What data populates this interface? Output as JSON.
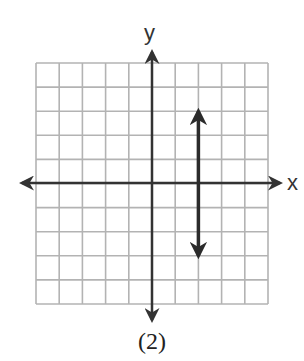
{
  "figure": {
    "caption": "(2)",
    "x_axis_label": "x",
    "y_axis_label": "y"
  },
  "grid": {
    "columns": 10,
    "rows": 10,
    "x_range": [
      -5,
      5
    ],
    "y_range": [
      -5,
      5
    ],
    "grid_color": "#b3b3b3",
    "axis_color": "#333333",
    "line_color": "#2b2b2b"
  },
  "graphed_line": {
    "description": "vertical line",
    "equation": "x = 2",
    "x": 2,
    "y_from": -3,
    "y_to": 3,
    "arrows": "both ends"
  },
  "chart_data": {
    "type": "line",
    "title": "(2)",
    "xlabel": "x",
    "ylabel": "y",
    "xlim": [
      -5,
      5
    ],
    "ylim": [
      -5,
      5
    ],
    "grid": true,
    "series": [
      {
        "name": "x = 2",
        "x": [
          2,
          2
        ],
        "y": [
          -3,
          3
        ]
      }
    ]
  }
}
